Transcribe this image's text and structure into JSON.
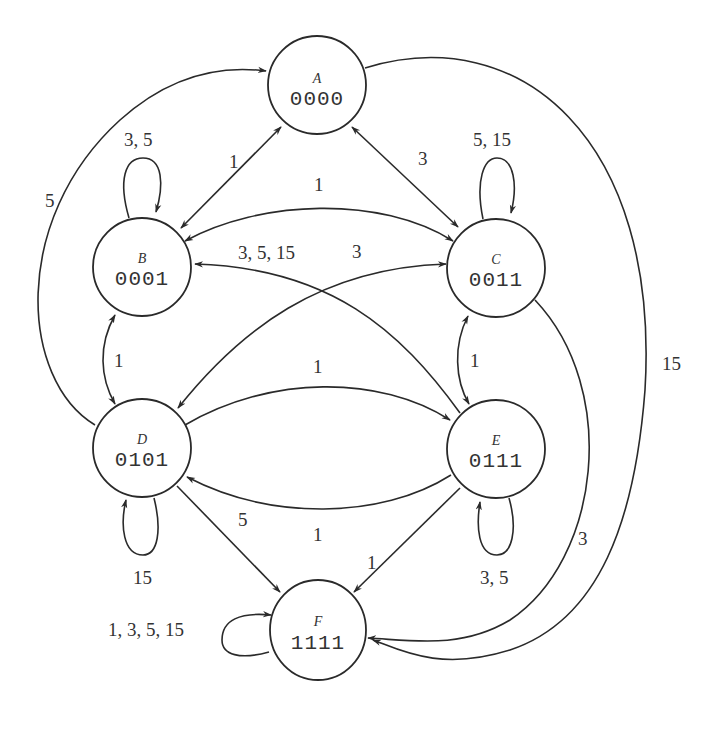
{
  "diagram": {
    "type": "state-transition-graph",
    "nodes": [
      {
        "id": "A",
        "name": "A",
        "code": "0000"
      },
      {
        "id": "B",
        "name": "B",
        "code": "0001"
      },
      {
        "id": "C",
        "name": "C",
        "code": "0011"
      },
      {
        "id": "D",
        "name": "D",
        "code": "0101"
      },
      {
        "id": "E",
        "name": "E",
        "code": "0111"
      },
      {
        "id": "F",
        "name": "F",
        "code": "1111"
      }
    ],
    "edges": [
      {
        "from": "A",
        "to": "B",
        "label": "1",
        "bidirectional": true
      },
      {
        "from": "A",
        "to": "C",
        "label": "3",
        "bidirectional": true
      },
      {
        "from": "D",
        "to": "A",
        "label": "5"
      },
      {
        "from": "A",
        "to": "F",
        "label": "15"
      },
      {
        "from": "B",
        "to": "B",
        "label": "3, 5"
      },
      {
        "from": "C",
        "to": "C",
        "label": "5, 15"
      },
      {
        "from": "B",
        "to": "C",
        "label": "1",
        "bidirectional": true
      },
      {
        "from": "E",
        "to": "B",
        "label": "3, 5, 15"
      },
      {
        "from": "D",
        "to": "C",
        "label": "3",
        "bidirectional": true
      },
      {
        "from": "B",
        "to": "D",
        "label": "1",
        "bidirectional": true
      },
      {
        "from": "C",
        "to": "E",
        "label": "1",
        "bidirectional": true
      },
      {
        "from": "D",
        "to": "E",
        "label": "1"
      },
      {
        "from": "E",
        "to": "D",
        "label": "1"
      },
      {
        "from": "C",
        "to": "F",
        "label": "3"
      },
      {
        "from": "D",
        "to": "D",
        "label": "15"
      },
      {
        "from": "E",
        "to": "E",
        "label": "3, 5"
      },
      {
        "from": "D",
        "to": "F",
        "label": "5"
      },
      {
        "from": "E",
        "to": "F",
        "label": "1"
      },
      {
        "from": "F",
        "to": "F",
        "label": "1, 3, 5, 15"
      }
    ]
  },
  "labels": {
    "A_B": "1",
    "A_C": "3",
    "D_A": "5",
    "A_F": "15",
    "B_loop": "3, 5",
    "C_loop": "5, 15",
    "B_C": "1",
    "E_B": "3, 5, 15",
    "D_C": "3",
    "B_D": "1",
    "C_E": "1",
    "D_E": "1",
    "E_D": "1",
    "C_F": "3",
    "D_loop": "15",
    "E_loop": "3, 5",
    "D_F": "5",
    "E_F": "1",
    "F_loop": "1, 3, 5, 15"
  }
}
